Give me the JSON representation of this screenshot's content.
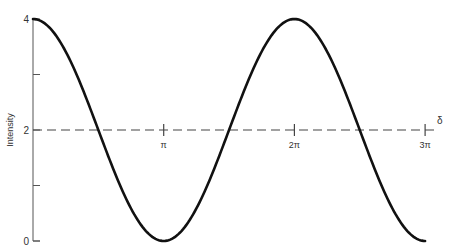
{
  "chart_data": {
    "type": "line",
    "title": "",
    "xlabel": "δ",
    "ylabel": "Intensity",
    "ylim": [
      0,
      4
    ],
    "xlim": [
      0,
      9.42478
    ],
    "y_ticks": [
      0,
      1,
      2,
      3,
      4
    ],
    "y_tick_labels": [
      "0",
      "",
      "2",
      "",
      "4"
    ],
    "x_ticks": [
      3.14159,
      6.28319,
      9.42478
    ],
    "x_tick_labels": [
      "π",
      "2π",
      "3π"
    ],
    "grid": false,
    "legend": null,
    "series": [
      {
        "name": "Intensity = 2 + 2cos(δ)",
        "style": "solid",
        "x": [
          0,
          0.7854,
          1.5708,
          2.3562,
          3.14159,
          3.927,
          4.7124,
          5.4978,
          6.28319,
          7.0686,
          7.854,
          8.6394,
          9.42478
        ],
        "values": [
          4,
          3.414,
          2,
          0.586,
          0,
          0.586,
          2,
          3.414,
          4,
          3.414,
          2,
          0.586,
          0
        ]
      },
      {
        "name": "Mean intensity",
        "style": "dashed",
        "x": [
          0,
          9.7
        ],
        "values": [
          2,
          2
        ]
      }
    ],
    "annotations": [
      "δ"
    ]
  }
}
